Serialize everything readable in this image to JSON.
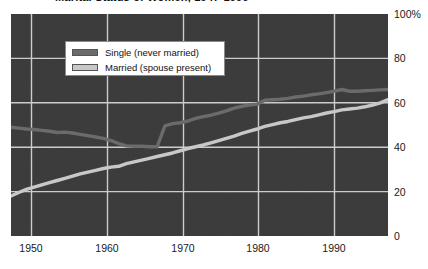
{
  "figure": {
    "title_sliver": "Marital Status of Women, 1947-1996",
    "background_color": "#3a3a3a",
    "page_background": "#ffffff"
  },
  "legend": {
    "position": "inside-top-left",
    "entries": [
      {
        "label": "Single (never married)",
        "color": "#6b6b6b",
        "icon": "legend-swatch-icon"
      },
      {
        "label": "Married (spouse present)",
        "color": "#c8c8c8",
        "icon": "legend-swatch-icon"
      }
    ]
  },
  "axes": {
    "y_ticks": [
      "100%",
      "80",
      "60",
      "40",
      "20",
      "0"
    ],
    "x_ticks": [
      "1950",
      "1960",
      "1970",
      "1980",
      "1990"
    ]
  },
  "chart_data": {
    "type": "line",
    "title": "Marital Status of Women, 1947-1996",
    "xlabel": "",
    "ylabel": "",
    "xlim": [
      1947,
      1996
    ],
    "ylim": [
      0,
      100
    ],
    "grid": true,
    "legend_position": "inside-top-left",
    "x_tick_values": [
      1950,
      1960,
      1970,
      1980,
      1990
    ],
    "y_tick_values": [
      0,
      20,
      40,
      60,
      80,
      100
    ],
    "y_tick_labels": [
      "0",
      "20",
      "40",
      "60",
      "80",
      "100%"
    ],
    "x": [
      1947,
      1948,
      1949,
      1950,
      1951,
      1952,
      1953,
      1954,
      1955,
      1956,
      1957,
      1958,
      1959,
      1960,
      1961,
      1962,
      1963,
      1964,
      1965,
      1966,
      1967,
      1968,
      1969,
      1970,
      1971,
      1972,
      1973,
      1974,
      1975,
      1976,
      1977,
      1978,
      1979,
      1980,
      1981,
      1982,
      1983,
      1984,
      1985,
      1986,
      1987,
      1988,
      1989,
      1990,
      1991,
      1992,
      1993,
      1994,
      1995,
      1996
    ],
    "series": [
      {
        "name": "Single (never married)",
        "color": "#6b6b6b",
        "values": [
          49.0,
          48.6,
          48.2,
          48.0,
          47.6,
          47.2,
          46.6,
          46.8,
          46.4,
          45.8,
          45.2,
          44.6,
          44.0,
          43.0,
          41.6,
          40.6,
          40.4,
          40.4,
          40.2,
          40.2,
          49.6,
          50.6,
          51.0,
          51.8,
          53.0,
          53.8,
          54.4,
          55.4,
          56.4,
          57.6,
          58.4,
          59.0,
          59.4,
          61.2,
          61.4,
          61.6,
          62.0,
          62.6,
          63.0,
          63.6,
          64.0,
          64.6,
          65.2,
          66.0,
          65.2,
          65.2,
          65.4,
          65.6,
          65.8,
          66.0
        ]
      },
      {
        "name": "Married (spouse present)",
        "color": "#c8c8c8",
        "values": [
          18.0,
          19.6,
          21.0,
          22.0,
          23.0,
          24.0,
          25.0,
          26.0,
          27.0,
          28.0,
          28.8,
          29.6,
          30.4,
          31.0,
          31.4,
          32.6,
          33.4,
          34.2,
          35.0,
          35.8,
          36.6,
          37.4,
          38.4,
          39.4,
          40.2,
          41.0,
          42.0,
          43.0,
          44.0,
          45.0,
          46.2,
          47.2,
          48.2,
          49.4,
          50.2,
          51.0,
          51.6,
          52.4,
          53.2,
          53.8,
          54.6,
          55.4,
          56.0,
          56.8,
          57.2,
          57.6,
          58.2,
          59.0,
          60.0,
          61.4
        ]
      }
    ]
  }
}
